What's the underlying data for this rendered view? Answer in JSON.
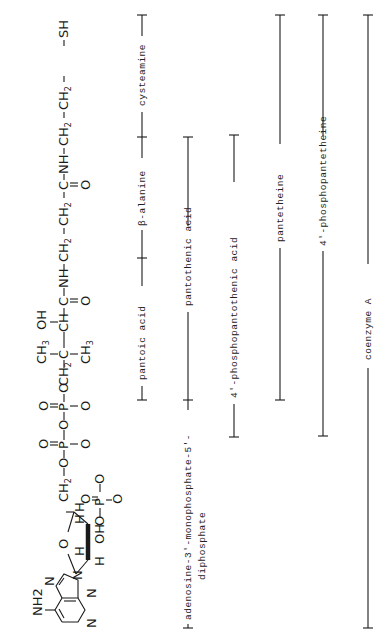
{
  "diagram": {
    "orientation": "rotated 90 degrees counter-clockwise",
    "formula": {
      "adenine": {
        "amino_group": "NH2",
        "ring_atoms": [
          "N",
          "N",
          "N",
          "N"
        ]
      },
      "ribose": {
        "ring_oxygen": "O",
        "hydrogens": [
          "H",
          "H",
          "H",
          "H"
        ],
        "hydroxyl": "OH",
        "phosphate_3prime": [
          "O",
          "=",
          "P",
          "O-",
          "O-"
        ]
      },
      "chain_segments": [
        "CH2",
        "-O-P(=O)(O-)-O-P(=O)(O-)-O-",
        "CH2-C(CH3)2",
        "-CH(OH)-C(=O)-NH-",
        "CH2-CH2-C(=O)-NH-",
        "CH2-CH2-SH"
      ],
      "text_tokens": {
        "ch2_5prime": "CH",
        "sub2": "2",
        "o": "O",
        "p": "P",
        "o_minus": "O",
        "minus": "-",
        "ch3": "CH",
        "sub3": "3",
        "oh": "OH",
        "c": "C",
        "ch": "CH",
        "nh": "NH",
        "sh": "SH",
        "ch2": "CH"
      }
    },
    "brackets": [
      {
        "id": "pantoic-acid",
        "label": "pantoic acid",
        "row": 1
      },
      {
        "id": "beta-alanine",
        "label": "β-alanine",
        "row": 1
      },
      {
        "id": "cysteamine",
        "label": "cysteamine",
        "row": 1
      },
      {
        "id": "adenosine-diphosphate",
        "label": "adenosine-3′-monophosphate-5′-",
        "label2": "diphosphate",
        "row": 2
      },
      {
        "id": "pantothenic-acid",
        "label": "pantothenic acid",
        "row": 2
      },
      {
        "id": "phosphopantothenic-acid",
        "label": "4′-phosphopantothenic acid",
        "row": 3
      },
      {
        "id": "pantetheine",
        "label": "pantetheine",
        "row": 4
      },
      {
        "id": "phosphopantetheine",
        "label": "4′-phosphopantetheine",
        "row": 5
      },
      {
        "id": "coenzyme-a",
        "label": "coenzyme A",
        "row": 6
      }
    ]
  }
}
